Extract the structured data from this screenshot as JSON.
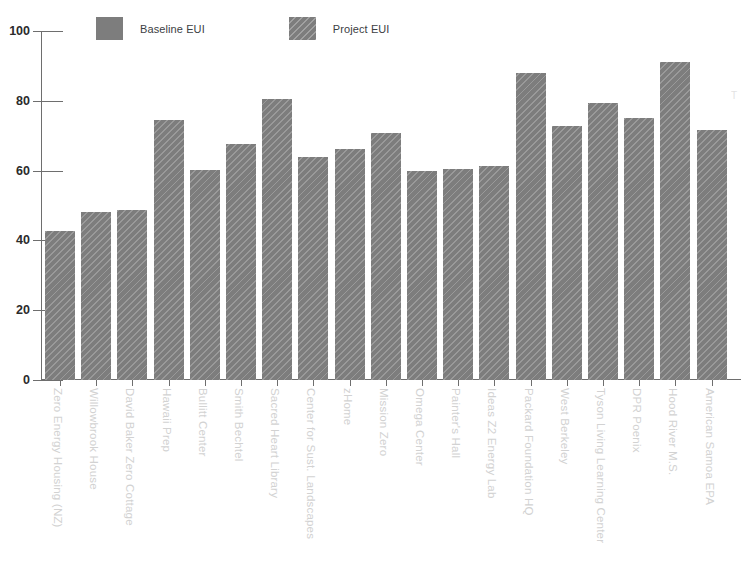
{
  "chart_data": {
    "type": "bar",
    "title": "",
    "xlabel": "",
    "ylabel": "",
    "ylim": [
      0,
      100
    ],
    "yticks": [
      0,
      20,
      40,
      60,
      80,
      100
    ],
    "grid": false,
    "legend_position": "top-left",
    "legend": [
      {
        "name": "Baseline EUI",
        "style": "solid",
        "color": "#7d7d7d"
      },
      {
        "name": "Project EUI",
        "style": "hatched",
        "color": "#7d7d7d"
      }
    ],
    "categories": [
      "Zero Energy Housing (NZ)",
      "Willowbrook House",
      "David Baker Zero Cottage",
      "Hawaii Prep",
      "Bullitt Center",
      "Smith Bechtel",
      "Sacred Heart Library",
      "Center for Sust. Landscapes",
      "zHome",
      "Mission Zero",
      "Omega Center",
      "Painter's Hall",
      "Ideas Z2 Energy Lab",
      "Packard Foundation HQ",
      "West Berkeley",
      "Tyson Living Learning Center",
      "DPR Poenix",
      "Hood River M.S.",
      "American Samoa EPA"
    ],
    "values": [
      42.8,
      48.0,
      48.7,
      74.6,
      60.2,
      67.6,
      80.6,
      64.0,
      66.2,
      70.9,
      60.0,
      60.6,
      61.4,
      88.0,
      72.8,
      79.5,
      75.2,
      91.0,
      71.7
    ]
  },
  "axis": {
    "y_tick_labels": [
      "100",
      "80",
      "60",
      "40",
      "20",
      "0"
    ]
  },
  "edge": {
    "clipped_text": "T"
  },
  "colors": {
    "bar": "#7d7d7d",
    "axis": "#6e6e6e",
    "tick_text": "#2b2b2b",
    "category_text": "#d2d2d2",
    "legend_text": "#3c4043",
    "background": "#ffffff"
  }
}
